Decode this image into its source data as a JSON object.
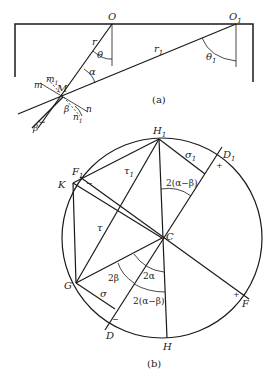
{
  "figure_a": {
    "caption": "(a)",
    "points": {
      "O": "O",
      "O1": "O",
      "O1_sub": "1",
      "M": "M"
    },
    "labels": {
      "r": "r",
      "r1": "r",
      "r1_sub": "1",
      "theta": "θ",
      "theta1": "θ",
      "theta1_sub": "1",
      "alpha": "α",
      "beta_lower": "β",
      "beta": "β",
      "m": "m",
      "m1": "m",
      "m1_sub": "1",
      "n": "n",
      "n1": "n",
      "n1_sub": "1"
    }
  },
  "figure_b": {
    "caption": "(b)",
    "points": {
      "H1": "H",
      "H1_sub": "1",
      "D1": "D",
      "D1_sub": "1",
      "F1": "F",
      "F1_sub": "1",
      "K": "K",
      "C": "C",
      "G": "G",
      "D": "D",
      "H": "H",
      "F": "F"
    },
    "labels": {
      "sigma1": "σ",
      "sigma1_sub": "1",
      "tau1": "τ",
      "tau1_sub": "1",
      "tau": "τ",
      "sigma": "σ",
      "angle_top": "2(α−β)",
      "angle_2beta": "2β",
      "angle_2alpha": "2α",
      "angle_bottom": "2(α−β)",
      "plus_D1": "+",
      "minus_F1": "−",
      "minus_D": "−",
      "plus_F": "+"
    }
  }
}
